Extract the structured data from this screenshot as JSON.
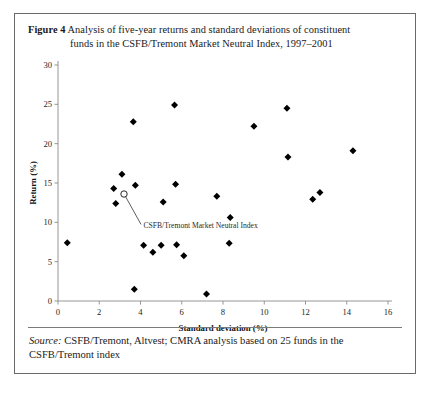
{
  "figure": {
    "label": "Figure 4",
    "caption_line1": "Analysis of five-year returns and standard deviations of constituent",
    "caption_line2": "funds in the CSFB/Tremont Market Neutral Index, 1997–2001",
    "source_word": "Source:",
    "source_line1": " CSFB/Tremont, Altvest; CMRA analysis based on 25 funds in the",
    "source_line2": "CSFB/Tremont index"
  },
  "chart_data": {
    "type": "scatter",
    "title": "Analysis of five-year returns and standard deviations of constituent funds in the CSFB/Tremont Market Neutral Index, 1997–2001",
    "xlabel": "Standard deviation (%)",
    "ylabel": "Return (%)",
    "xlim": [
      0,
      16
    ],
    "ylim": [
      0,
      30
    ],
    "xticks": [
      0,
      2,
      4,
      6,
      8,
      10,
      12,
      14,
      16
    ],
    "yticks": [
      0,
      5,
      10,
      15,
      20,
      25,
      30
    ],
    "xtick_labels": [
      "0",
      "2",
      "4",
      "6",
      "8",
      "10",
      "12",
      "14",
      "16"
    ],
    "ytick_labels": [
      "0",
      "5",
      "10",
      "15",
      "20",
      "25",
      "30"
    ],
    "grid": false,
    "legend": false,
    "marker": "diamond",
    "marker_color": "#000000",
    "series": [
      {
        "name": "Constituent funds",
        "marker": "diamond",
        "points": [
          {
            "x": 0.45,
            "y": 7.4
          },
          {
            "x": 2.7,
            "y": 14.3
          },
          {
            "x": 2.8,
            "y": 12.4
          },
          {
            "x": 3.1,
            "y": 16.1
          },
          {
            "x": 3.65,
            "y": 22.8
          },
          {
            "x": 3.7,
            "y": 1.5
          },
          {
            "x": 3.75,
            "y": 14.7
          },
          {
            "x": 4.15,
            "y": 7.1
          },
          {
            "x": 4.6,
            "y": 6.2
          },
          {
            "x": 5.0,
            "y": 7.1
          },
          {
            "x": 5.1,
            "y": 12.6
          },
          {
            "x": 5.65,
            "y": 24.9
          },
          {
            "x": 5.7,
            "y": 14.85
          },
          {
            "x": 5.75,
            "y": 7.15
          },
          {
            "x": 6.1,
            "y": 5.75
          },
          {
            "x": 7.2,
            "y": 0.9
          },
          {
            "x": 7.7,
            "y": 13.3
          },
          {
            "x": 8.3,
            "y": 7.35
          },
          {
            "x": 8.35,
            "y": 10.6
          },
          {
            "x": 9.5,
            "y": 22.2
          },
          {
            "x": 11.1,
            "y": 24.5
          },
          {
            "x": 11.15,
            "y": 18.3
          },
          {
            "x": 12.35,
            "y": 12.95
          },
          {
            "x": 12.7,
            "y": 13.8
          },
          {
            "x": 14.3,
            "y": 19.1
          }
        ]
      },
      {
        "name": "CSFB/Tremont Market Neutral Index",
        "marker": "open-circle",
        "points": [
          {
            "x": 3.2,
            "y": 13.6
          }
        ]
      }
    ],
    "annotations": [
      {
        "text": "CSFB/Tremont Market Neutral Index",
        "target": {
          "x": 3.2,
          "y": 13.6
        },
        "label_at": {
          "x": 4.05,
          "y": 9.35
        }
      }
    ]
  }
}
